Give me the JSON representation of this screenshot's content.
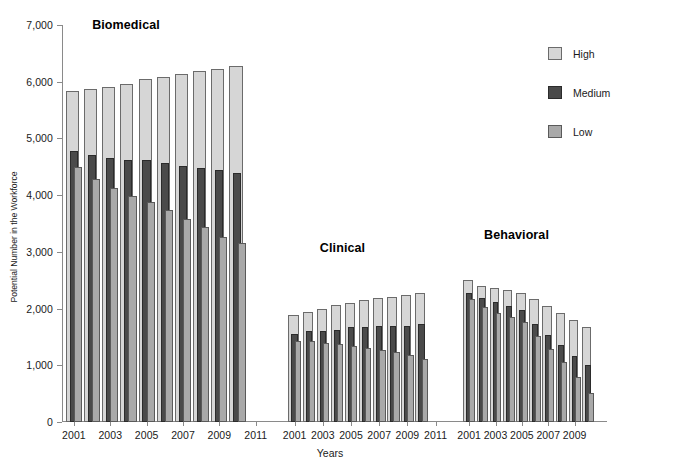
{
  "chart_data": {
    "type": "bar",
    "title": "",
    "xlabel": "Years",
    "ylabel": "Potential Number in the Workforce",
    "ylim": [
      0,
      7000
    ],
    "ytick_values": [
      0,
      1000,
      2000,
      3000,
      4000,
      5000,
      6000,
      7000
    ],
    "ytick_labels": [
      "0",
      "1,000",
      "2,000",
      "3,000",
      "4,000",
      "5,000",
      "6,000",
      "7,000"
    ],
    "grid": false,
    "legend_position": "right",
    "legend": [
      {
        "name": "High",
        "color": "#d6d6d6"
      },
      {
        "name": "Medium",
        "color": "#4a4a4a"
      },
      {
        "name": "Low",
        "color": "#a9a9a9"
      }
    ],
    "panels": [
      {
        "title": "Biomedical",
        "x": [
          2001,
          2002,
          2003,
          2004,
          2005,
          2006,
          2007,
          2008,
          2009,
          2010
        ],
        "xtick_labels": [
          "2001",
          "2003",
          "2005",
          "2007",
          "2009",
          "2011"
        ],
        "xtick_years": [
          2001,
          2003,
          2005,
          2007,
          2009,
          2011
        ],
        "series": [
          {
            "name": "High",
            "values": [
              5840,
              5870,
              5910,
              5960,
              6050,
              6080,
              6130,
              6190,
              6230,
              6270
            ]
          },
          {
            "name": "Medium",
            "values": [
              4780,
              4710,
              4650,
              4620,
              4620,
              4560,
              4510,
              4480,
              4450,
              4390
            ]
          },
          {
            "name": "Low",
            "values": [
              4490,
              4290,
              4130,
              3990,
              3880,
              3730,
              3580,
              3430,
              3260,
              3150
            ]
          }
        ]
      },
      {
        "title": "Clinical",
        "x": [
          2001,
          2002,
          2003,
          2004,
          2005,
          2006,
          2007,
          2008,
          2009,
          2010
        ],
        "xtick_labels": [
          "2001",
          "2003",
          "2005",
          "2007",
          "2009",
          "2011"
        ],
        "xtick_years": [
          2001,
          2003,
          2005,
          2007,
          2009,
          2011
        ],
        "series": [
          {
            "name": "High",
            "values": [
              1880,
              1940,
              1990,
              2060,
              2100,
              2160,
              2190,
              2210,
              2240,
              2270
            ]
          },
          {
            "name": "Medium",
            "values": [
              1550,
              1600,
              1610,
              1630,
              1670,
              1680,
              1690,
              1700,
              1700,
              1720
            ]
          },
          {
            "name": "Low",
            "values": [
              1430,
              1420,
              1400,
              1380,
              1340,
              1310,
              1270,
              1230,
              1180,
              1110
            ]
          }
        ]
      },
      {
        "title": "Behavioral",
        "x": [
          2001,
          2002,
          2003,
          2004,
          2005,
          2006,
          2007,
          2008,
          2009,
          2010
        ],
        "xtick_labels": [
          "2001",
          "2003",
          "2005",
          "2007",
          "2009"
        ],
        "xtick_years": [
          2001,
          2003,
          2005,
          2007,
          2009
        ],
        "series": [
          {
            "name": "High",
            "values": [
              2510,
              2400,
              2370,
              2330,
              2280,
              2170,
              2040,
              1930,
              1800,
              1680
            ]
          },
          {
            "name": "Medium",
            "values": [
              2270,
              2180,
              2120,
              2050,
              1970,
              1730,
              1540,
              1350,
              1160,
              1000
            ]
          },
          {
            "name": "Low",
            "values": [
              2170,
              2030,
              1930,
              1850,
              1760,
              1520,
              1280,
              1060,
              790,
              510
            ]
          }
        ]
      }
    ]
  }
}
